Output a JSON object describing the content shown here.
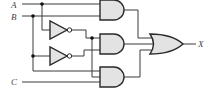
{
  "diagram": {
    "type": "logic-circuit",
    "inputs": [
      {
        "label": "A"
      },
      {
        "label": "B"
      },
      {
        "label": "C"
      }
    ],
    "output": {
      "label": "X"
    },
    "gates": [
      {
        "id": "not1",
        "type": "NOT",
        "input": "A"
      },
      {
        "id": "not2",
        "type": "NOT",
        "input": "B"
      },
      {
        "id": "and1",
        "type": "AND",
        "inputs": [
          "A",
          "B"
        ]
      },
      {
        "id": "and2",
        "type": "AND",
        "inputs": [
          "not1",
          "not2"
        ]
      },
      {
        "id": "and3",
        "type": "AND",
        "inputs": [
          "not1",
          "B",
          "C"
        ]
      },
      {
        "id": "or1",
        "type": "OR",
        "inputs": [
          "and1",
          "and2",
          "and3"
        ],
        "output": "X"
      }
    ],
    "colors": {
      "gate_fill": "#e3e3e3",
      "wire": "#3a3a3a",
      "label": "#444444"
    }
  }
}
